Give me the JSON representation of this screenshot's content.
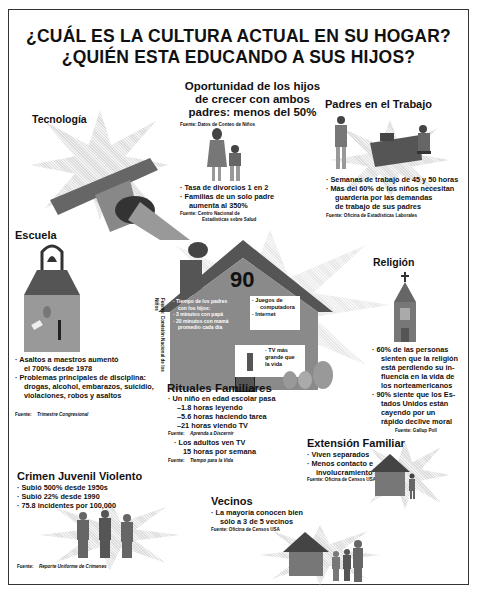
{
  "header": {
    "title_line1": "¿CUÁL ES LA CULTURA ACTUAL EN SU HOGAR?",
    "title_line2": "¿QUIÉN ESTA EDUCANDO A SUS HIJOS?"
  },
  "sections": {
    "oportunidad": {
      "heading_line1": "Oportunidad de los hijos",
      "heading_line2": "de crecer con ambos",
      "heading_line3": "padres: menos del 50%",
      "source_top": "Fuente:  Datos de Conteo de Niños",
      "bullet1": "· Tasa de divorcios 1 en 2",
      "bullet2": "· Familias de un solo padre",
      "bullet2_cont": "aumenta al 350%",
      "source_bottom_line1": "Fuente:  Centro Nacional de",
      "source_bottom_line2": "Estadísticas sobre Salud"
    },
    "tecnologia": {
      "heading": "Tecnología"
    },
    "padres_trabajo": {
      "heading": "Padres en el Trabajo",
      "bullet1": "· Semanas de trabajo de 45 y 50 horas",
      "bullet2": "· Más del 60% de los niños necesitan",
      "bullet2_cont1": "guardería por las demandas",
      "bullet2_cont2": "de trabajo de sus padres",
      "source": "Fuente:  Oficina de Estadísticas Laborales"
    },
    "escuela": {
      "heading": "Escuela",
      "bullet1": "· Asaltos a maestros aumentó",
      "bullet1_cont": "el 700% desde 1978",
      "bullet2": "· Problemas principales de disciplina:",
      "bullet2_cont1": "drogas, alcohol, embarazos, suicidio,",
      "bullet2_cont2": "violaciones, robos y asaltos",
      "source_label": "Fuente:",
      "source_name": "Trimestre Congresional"
    },
    "hogar": {
      "number": "90",
      "tiempo_line1": "· Tiempo de los padres",
      "tiempo_line2": "con los hijos:",
      "tiempo_line3": "· 3 minutos con papá",
      "tiempo_line4": "· 20 minutos con mamá",
      "tiempo_line5": "promedio cada día",
      "juegos_line1": "· Juegos de",
      "juegos_line2": "computadora",
      "juegos_line3": "· Internet",
      "tv_line1": "· TV más",
      "tv_line2": "grande que",
      "tv_line3": "la vida",
      "vertical_source_line1": "Fuente: Comisión",
      "vertical_source_line2": "Nacional de los Niños"
    },
    "rituales": {
      "heading": "Rituales Familiares",
      "bullet1": "· Un niño en edad escolar pasa",
      "sub1": "–1.8 horas leyendo",
      "sub2": "–5.6 horas haciendo tarea",
      "sub3": "–21 horas viendo TV",
      "source1_label": "Fuente:",
      "source1_name": "Aprenda a Discernir",
      "bullet2": "· Los adultos ven TV",
      "bullet2_cont": "15 horas por semana",
      "source2_label": "Fuente:",
      "source2_name": "Tiempo para la Vida"
    },
    "religion": {
      "heading": "Religión",
      "bullet1_lines": [
        "· 60% de las personas",
        "sienten que la religión",
        "está perdiendo su in-",
        "fluencia en la vida de",
        "los norteamericanos"
      ],
      "bullet2_lines": [
        "· 90% siente que los Es-",
        "tados Unidos están",
        "cayendo por un",
        "rápido declive moral"
      ],
      "source": "Fuente:  Gallup Poll"
    },
    "extension": {
      "heading": "Extensión Familiar",
      "bullet1": "· Viven separados",
      "bullet2": "· Menos contacto e",
      "bullet2_cont": "involucramiento",
      "source": "Fuente:  Oficina de Censos USA"
    },
    "crimen": {
      "heading": "Crimen Juvenil Violento",
      "bullet1": "· Subió 500% desde 1950s",
      "bullet2": "· Subió 22% desde 1990",
      "bullet3": "· 75.8 incidentes por 100,000",
      "source_label": "Fuente:",
      "source_name": "Reporte Uniforme de Crímenes"
    },
    "vecinos": {
      "heading": "Vecinos",
      "bullet1": "· La mayoría conocen bien",
      "bullet1_cont": "sólo a 3 de 5 vecinos",
      "source": "Fuente:  Oficina de Censos USA"
    }
  },
  "icons": {
    "satellite": "satellite-icon",
    "mother_child": "mother-child-icon",
    "office_workers": "office-workers-icon",
    "school_bell": "school-bell-icon",
    "church": "church-icon",
    "house": "house-icon",
    "youths": "youths-icon",
    "small_house": "small-house-icon",
    "family": "family-icon"
  },
  "colors": {
    "ink": "#111111",
    "frame": "#333333",
    "dither_dark": "#555555",
    "dither_light": "#d8d8d8"
  }
}
